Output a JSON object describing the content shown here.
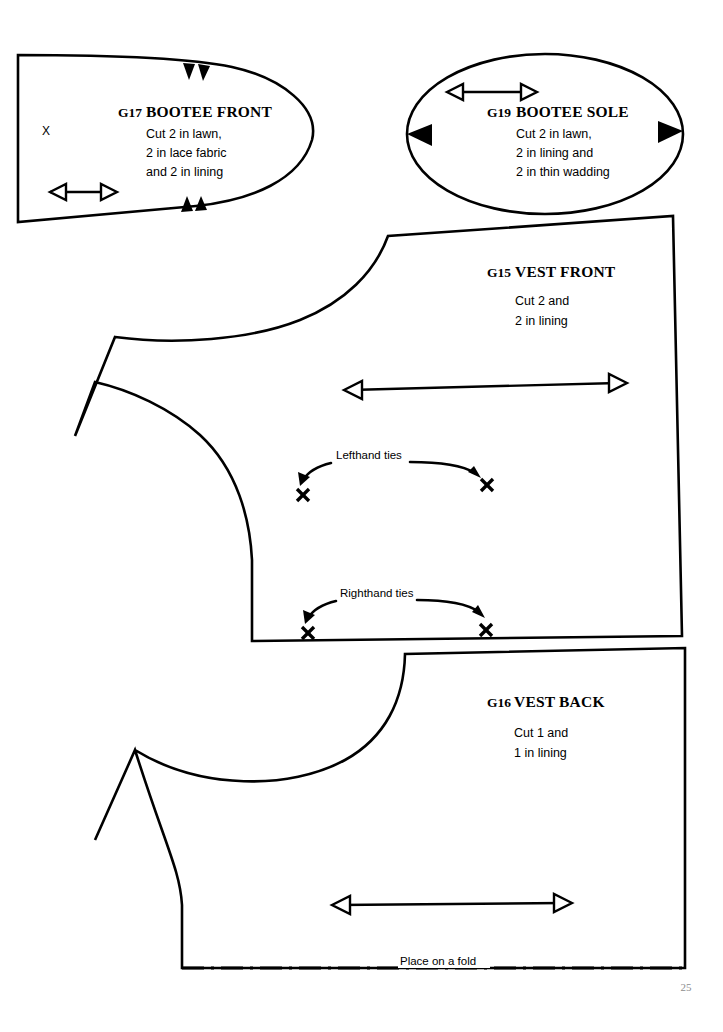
{
  "page": {
    "number": "25",
    "width": 723,
    "height": 1032,
    "background": "#ffffff",
    "ink": "#000000",
    "page_number_color": "#8d8d8d"
  },
  "pieces": {
    "bootee_front": {
      "code": "G17",
      "name": "BOOTEE FRONT",
      "instructions": [
        "Cut 2 in lawn,",
        "2 in lace fabric",
        "and 2 in lining"
      ],
      "mark": "X",
      "notch_count": 4,
      "grainline": "double-headed-arrow"
    },
    "bootee_sole": {
      "code": "G19",
      "name": "BOOTEE SOLE",
      "instructions": [
        "Cut 2 in lawn,",
        "2 in lining and",
        "2 in thin wadding"
      ],
      "notch_count": 2,
      "grainline": "double-headed-arrow"
    },
    "vest_front": {
      "code": "G15",
      "name": "VEST FRONT",
      "instructions": [
        "Cut 2 and",
        "2 in lining"
      ],
      "grainline": "double-headed-arrow",
      "annotations": [
        {
          "label": "Lefthand ties",
          "marks": 2
        },
        {
          "label": "Righthand ties",
          "marks": 2
        }
      ]
    },
    "vest_back": {
      "code": "G16",
      "name": "VEST BACK",
      "instructions": [
        "Cut 1 and",
        "1 in lining"
      ],
      "grainline": "double-headed-arrow",
      "fold_label": "Place on a fold"
    }
  }
}
